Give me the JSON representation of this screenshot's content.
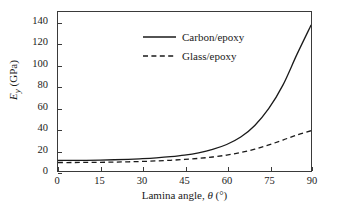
{
  "chart_data": {
    "type": "line",
    "title": "",
    "xlabel": "Lamina angle, θ (°)",
    "xlabel_parts": {
      "prefix": "Lamina angle, ",
      "symbol": "θ",
      "unit": " (°)"
    },
    "ylabel": "E_y (GPa)",
    "ylabel_parts": {
      "symbol": "E",
      "subscript": "y",
      "unit": " (GPa)"
    },
    "xlim": [
      0,
      90
    ],
    "ylim": [
      0,
      150
    ],
    "xticks": [
      0,
      15,
      30,
      45,
      60,
      75,
      90
    ],
    "yticks": [
      0,
      20,
      40,
      60,
      80,
      100,
      120,
      140
    ],
    "xtick_labels": [
      "0",
      "15",
      "30",
      "45",
      "60",
      "75",
      "90"
    ],
    "ytick_labels": [
      "0",
      "20",
      "40",
      "60",
      "80",
      "100",
      "120",
      "140"
    ],
    "grid": false,
    "legend_position": "upper-center-left",
    "line_color": "#1a1a1a",
    "background_color": "#ffffff",
    "axis_color": "#3a3a3a",
    "x": [
      0,
      5,
      10,
      15,
      20,
      25,
      30,
      35,
      40,
      45,
      50,
      55,
      60,
      65,
      70,
      75,
      80,
      85,
      90
    ],
    "series": [
      {
        "name": "Carbon/epoxy",
        "style": "solid",
        "values": [
          10.0,
          10.0,
          10.1,
          10.3,
          10.6,
          11.0,
          11.6,
          12.4,
          13.5,
          15.0,
          17.2,
          20.4,
          25.0,
          32.0,
          43.0,
          59.0,
          81.0,
          110.0,
          137.5
        ]
      },
      {
        "name": "Glass/epoxy",
        "style": "dashed",
        "values": [
          8.0,
          8.0,
          8.1,
          8.2,
          8.4,
          8.7,
          9.0,
          9.5,
          10.1,
          10.9,
          11.9,
          13.2,
          15.0,
          17.4,
          20.6,
          24.6,
          29.2,
          34.0,
          38.0
        ]
      }
    ]
  },
  "legend": {
    "items": [
      {
        "label": "Carbon/epoxy",
        "style": "solid"
      },
      {
        "label": "Glass/epoxy",
        "style": "dashed"
      }
    ]
  }
}
